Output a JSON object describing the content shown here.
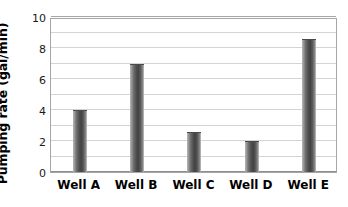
{
  "chart_data": {
    "type": "bar",
    "title": "",
    "xlabel": "",
    "ylabel": "Pumping rate (gal/min)",
    "categories": [
      "Well A",
      "Well B",
      "Well C",
      "Well D",
      "Well E"
    ],
    "values": [
      4.0,
      7.0,
      2.6,
      2.0,
      8.6
    ],
    "ylim": [
      0,
      10
    ],
    "ytick_labels": [
      "0",
      "2",
      "4",
      "6",
      "8",
      "10"
    ],
    "ytick_values": [
      0,
      2,
      4,
      6,
      8,
      10
    ],
    "ytick_interval": 2,
    "gridline_values": [
      1,
      2,
      3,
      4,
      5,
      6,
      7,
      8,
      9,
      10
    ],
    "grid": true,
    "grid_orientation": "horizontal",
    "legend": false,
    "legend_position": "none",
    "series": [
      {
        "name": "Pumping rate",
        "values": [
          4.0,
          7.0,
          2.6,
          2.0,
          8.6
        ]
      }
    ],
    "bar_color": "#4a4a4a",
    "grid_color": "#d4d4d4",
    "frame_color": "#a6a6a6",
    "background_color": "#ffffff"
  },
  "axis": {
    "y_title": "Pumping rate (gal/min)"
  }
}
